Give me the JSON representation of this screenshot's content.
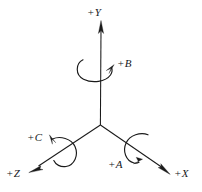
{
  "diagram": {
    "background_color": "#ffffff",
    "stroke_color": "#1a1a1a",
    "canvas": {
      "width": 202,
      "height": 192
    },
    "origin": {
      "x": 100,
      "y": 125
    },
    "linear_axes": [
      {
        "id": "y-axis",
        "label": "+Y",
        "direction": "up",
        "label_position": {
          "x": 87,
          "y": 7
        },
        "tip": {
          "x": 101,
          "y": 21
        },
        "tail": {
          "x": 100,
          "y": 125
        }
      },
      {
        "id": "x-axis",
        "label": "+X",
        "direction": "down-right",
        "label_position": {
          "x": 174,
          "y": 170
        },
        "tip": {
          "x": 170,
          "y": 174
        },
        "tail": {
          "x": 100,
          "y": 125
        }
      },
      {
        "id": "z-axis",
        "label": "+Z",
        "direction": "down-left",
        "label_position": {
          "x": 6,
          "y": 168
        },
        "tip": {
          "x": 29,
          "y": 172
        },
        "tail": {
          "x": 100,
          "y": 125
        }
      }
    ],
    "rotary_axes": [
      {
        "id": "b-rotation",
        "label": "+B",
        "about_axis": "Y",
        "label_position": {
          "x": 117,
          "y": 58
        },
        "arc_center": {
          "x": 97,
          "y": 70
        },
        "arrow_tip": {
          "x": 114,
          "y": 66
        }
      },
      {
        "id": "c-rotation",
        "label": "+C",
        "about_axis": "Z",
        "label_position": {
          "x": 27,
          "y": 132
        },
        "arc_center": {
          "x": 63,
          "y": 152
        },
        "arrow_tip": {
          "x": 50,
          "y": 135
        }
      },
      {
        "id": "a-rotation",
        "label": "+A",
        "about_axis": "X",
        "label_position": {
          "x": 108,
          "y": 159
        },
        "arc_center": {
          "x": 136,
          "y": 150
        },
        "arrow_tip": {
          "x": 137,
          "y": 159
        }
      }
    ]
  }
}
